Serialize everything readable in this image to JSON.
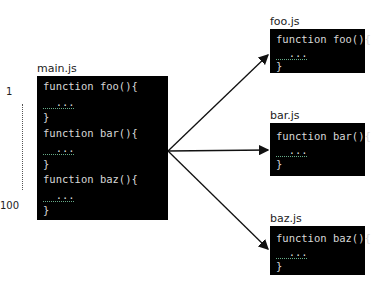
{
  "main": {
    "filename": "main.js",
    "lines": [
      "function foo(){",
      "  ...",
      "}",
      "function bar(){",
      "  ...",
      "}",
      "function baz(){",
      "  ...",
      "}"
    ],
    "line_start": "1",
    "line_end": "100"
  },
  "files": [
    {
      "filename": "foo.js",
      "lines": [
        "function foo(){",
        "  ...",
        "}"
      ]
    },
    {
      "filename": "bar.js",
      "lines": [
        "function bar(){",
        "  ...",
        "}"
      ]
    },
    {
      "filename": "baz.js",
      "lines": [
        "function baz(){",
        "  ...",
        "}"
      ]
    }
  ]
}
